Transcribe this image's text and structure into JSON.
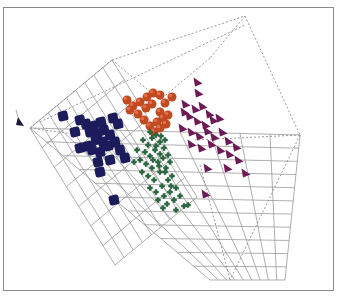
{
  "chart_data": {
    "type": "scatter",
    "subtype": "3d-scatter",
    "title": "",
    "xlabel": "",
    "ylabel": "",
    "zlabel": "",
    "grid": true,
    "legend": "none",
    "frame": {
      "x": 3,
      "y": 7,
      "w": 331,
      "h": 284,
      "stroke": "#8a8a8a"
    },
    "box": {
      "solid_grid_color": "#9a9a9a",
      "dashed_color": "#8f8f8f",
      "dashed_edges": [
        [
          [
            30,
            128
          ],
          [
            112,
            60
          ]
        ],
        [
          [
            112,
            60
          ],
          [
            245,
            16
          ]
        ],
        [
          [
            245,
            16
          ],
          [
            300,
            135
          ]
        ],
        [
          [
            300,
            135
          ],
          [
            230,
            280
          ]
        ],
        [
          [
            30,
            128
          ],
          [
            80,
            135
          ]
        ],
        [
          [
            112,
            60
          ],
          [
            160,
            100
          ]
        ],
        [
          [
            245,
            16
          ],
          [
            210,
            58
          ]
        ],
        [
          [
            300,
            135
          ],
          [
            195,
            140
          ]
        ],
        [
          [
            210,
            58
          ],
          [
            160,
            100
          ]
        ],
        [
          [
            200,
            165
          ],
          [
            230,
            280
          ]
        ],
        [
          [
            40,
            122
          ],
          [
            245,
            25
          ]
        ]
      ],
      "floor_grid": {
        "origin": [
          30,
          128
        ],
        "u_end": [
          210,
          280
        ],
        "v_end": [
          300,
          135
        ],
        "far": [
          285,
          280
        ],
        "u_lines": 11,
        "v_lines": 9
      },
      "wall_grid": {
        "origin": [
          30,
          128
        ],
        "top": [
          112,
          60
        ],
        "down": [
          115,
          265
        ],
        "u_lines": 7,
        "v_lines": 9
      }
    },
    "axis_marker": {
      "x": 18,
      "y": 122,
      "color": "#1a1a3a"
    },
    "series": [
      {
        "name": "cluster-navy",
        "marker": "cube",
        "color": "#1c1c5c",
        "points": [
          [
            63,
            116
          ],
          [
            80,
            120
          ],
          [
            86,
            124
          ],
          [
            93,
            126
          ],
          [
            101,
            122
          ],
          [
            113,
            118
          ],
          [
            118,
            124
          ],
          [
            90,
            132
          ],
          [
            97,
            134
          ],
          [
            104,
            130
          ],
          [
            110,
            135
          ],
          [
            96,
            140
          ],
          [
            103,
            142
          ],
          [
            88,
            146
          ],
          [
            80,
            148
          ],
          [
            92,
            150
          ],
          [
            100,
            152
          ],
          [
            108,
            146
          ],
          [
            115,
            142
          ],
          [
            120,
            150
          ],
          [
            98,
            162
          ],
          [
            110,
            160
          ],
          [
            125,
            158
          ],
          [
            100,
            172
          ],
          [
            114,
            200
          ],
          [
            75,
            132
          ]
        ],
        "size": 10
      },
      {
        "name": "cluster-orange",
        "marker": "sphere",
        "color": "#c24a22",
        "points": [
          [
            127,
            100
          ],
          [
            133,
            106
          ],
          [
            140,
            102
          ],
          [
            147,
            97
          ],
          [
            153,
            93
          ],
          [
            160,
            95
          ],
          [
            165,
            103
          ],
          [
            172,
            97
          ],
          [
            146,
            108
          ],
          [
            152,
            104
          ],
          [
            160,
            112
          ],
          [
            130,
            110
          ],
          [
            138,
            114
          ],
          [
            144,
            120
          ],
          [
            150,
            126
          ],
          [
            157,
            122
          ],
          [
            163,
            118
          ],
          [
            168,
            115
          ],
          [
            154,
            132
          ],
          [
            160,
            128
          ],
          [
            166,
            124
          ]
        ],
        "size": 9
      },
      {
        "name": "cluster-green",
        "marker": "cross",
        "color": "#2e6a44",
        "points": [
          [
            143,
            140
          ],
          [
            148,
            145
          ],
          [
            152,
            138
          ],
          [
            156,
            146
          ],
          [
            160,
            142
          ],
          [
            145,
            152
          ],
          [
            150,
            156
          ],
          [
            155,
            150
          ],
          [
            160,
            154
          ],
          [
            164,
            148
          ],
          [
            140,
            160
          ],
          [
            146,
            164
          ],
          [
            152,
            168
          ],
          [
            158,
            162
          ],
          [
            163,
            158
          ],
          [
            168,
            155
          ],
          [
            142,
            172
          ],
          [
            148,
            176
          ],
          [
            154,
            180
          ],
          [
            160,
            172
          ],
          [
            166,
            168
          ],
          [
            170,
            162
          ],
          [
            150,
            188
          ],
          [
            156,
            192
          ],
          [
            162,
            186
          ],
          [
            168,
            180
          ],
          [
            172,
            176
          ],
          [
            158,
            200
          ],
          [
            164,
            196
          ],
          [
            170,
            192
          ],
          [
            176,
            188
          ],
          [
            167,
            204
          ],
          [
            174,
            200
          ],
          [
            180,
            196
          ],
          [
            184,
            206
          ],
          [
            176,
            210
          ],
          [
            137,
            150
          ],
          [
            134,
            162
          ],
          [
            150,
            132
          ],
          [
            156,
            135
          ],
          [
            161,
            136
          ],
          [
            165,
            140
          ],
          [
            153,
            160
          ],
          [
            159,
            166
          ],
          [
            165,
            172
          ],
          [
            171,
            186
          ],
          [
            163,
            208
          ],
          [
            188,
            205
          ]
        ],
        "size": 5
      },
      {
        "name": "cluster-purple",
        "marker": "cone",
        "color": "#6e1a55",
        "points": [
          [
            198,
            82
          ],
          [
            199,
            93
          ],
          [
            186,
            104
          ],
          [
            196,
            109
          ],
          [
            203,
            106
          ],
          [
            210,
            114
          ],
          [
            190,
            116
          ],
          [
            198,
            121
          ],
          [
            206,
            125
          ],
          [
            214,
            120
          ],
          [
            220,
            118
          ],
          [
            183,
            128
          ],
          [
            192,
            132
          ],
          [
            200,
            136
          ],
          [
            208,
            131
          ],
          [
            215,
            137
          ],
          [
            223,
            132
          ],
          [
            229,
            141
          ],
          [
            192,
            144
          ],
          [
            202,
            148
          ],
          [
            212,
            144
          ],
          [
            221,
            150
          ],
          [
            230,
            154
          ],
          [
            239,
            160
          ],
          [
            208,
            168
          ],
          [
            228,
            168
          ],
          [
            246,
            173
          ],
          [
            206,
            194
          ],
          [
            185,
            112
          ],
          [
            237,
            147
          ]
        ],
        "size": 9
      }
    ]
  }
}
